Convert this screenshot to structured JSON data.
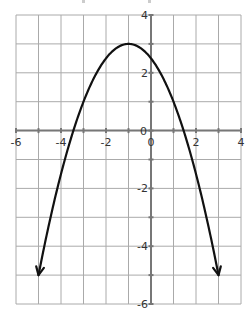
{
  "chart_data": {
    "type": "line",
    "title": "",
    "xlabel": "",
    "ylabel": "",
    "xlim": [
      -6,
      4
    ],
    "ylim": [
      -6,
      4
    ],
    "grid": true,
    "x_tick_labels": [
      "-6",
      "-4",
      "-2",
      "0",
      "2",
      "4"
    ],
    "x_ticks": [
      -6,
      -4,
      -2,
      0,
      2,
      4
    ],
    "y_tick_labels": [
      "4",
      "2",
      "0",
      "-2",
      "-4",
      "-6"
    ],
    "y_ticks": [
      4,
      2,
      0,
      -2,
      -4,
      -6
    ],
    "function": "y = -0.5(x + 1)^2 + 3",
    "vertex": [
      -1,
      3
    ],
    "x_intercepts": [
      -3.45,
      1.45
    ],
    "y_intercept": 2.5,
    "arrow_endpoints": [
      [
        -5,
        -5
      ],
      [
        3,
        -5
      ]
    ],
    "series": [
      {
        "name": "parabola",
        "x": [
          -5,
          -4,
          -3,
          -2,
          -1,
          0,
          1,
          2,
          3
        ],
        "values": [
          -5,
          -1.5,
          1,
          2.5,
          3,
          2.5,
          1,
          -1.5,
          -5
        ]
      }
    ],
    "colors": {
      "grid": "#aaaaaa",
      "axis": "#777777",
      "curve": "#111111",
      "label": "#333333"
    }
  }
}
